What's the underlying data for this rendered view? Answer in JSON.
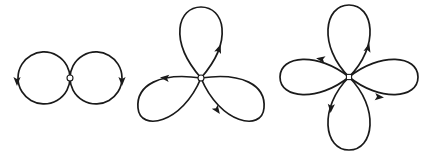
{
  "diagram": {
    "colors": {
      "stroke": "#1a1a1a",
      "background": "#ffffff",
      "node_fill": "#ffffff"
    },
    "figures": [
      {
        "name": "two-loop-figure",
        "petal_count": 2,
        "center": [
          70,
          78
        ],
        "node": "circle",
        "loops": [
          {
            "name": "left-loop",
            "path": "M70,78 A26,26 0 1,1 70,77.9",
            "cx": 44,
            "cy": 78,
            "r": 26
          },
          {
            "name": "right-loop",
            "path": "M70,78 A26,26 0 1,0 70,77.9",
            "cx": 96,
            "cy": 78,
            "r": 26
          }
        ],
        "arrows": [
          {
            "name": "left-loop-arrow",
            "x": 17,
            "y": 81,
            "angle": 90
          },
          {
            "name": "right-loop-arrow",
            "x": 122,
            "y": 81,
            "angle": 90
          }
        ]
      },
      {
        "name": "three-petal-figure",
        "petal_count": 3,
        "center": [
          201,
          78
        ],
        "node": "circle",
        "loops": [
          {
            "name": "top-petal",
            "path": "M201,78 C168,40 178,7 201,7 C224,7 234,40 201,78"
          },
          {
            "name": "lower-left-petal",
            "path": "M201,78 C160,72 136,85 138,108 C140,132 182,124 201,78"
          },
          {
            "name": "lower-right-petal",
            "path": "M201,78 C242,72 266,85 264,108 C262,132 220,124 201,78"
          }
        ],
        "arrows": [
          {
            "name": "top-petal-arrow",
            "x": 219,
            "y": 49,
            "angle": -70
          },
          {
            "name": "lower-left-petal-arrow",
            "x": 165,
            "y": 78,
            "angle": 185
          },
          {
            "name": "lower-right-petal-arrow",
            "x": 217,
            "y": 110,
            "angle": 55
          }
        ]
      },
      {
        "name": "four-petal-figure",
        "petal_count": 4,
        "center": [
          349,
          77
        ],
        "node": "square",
        "loops": [
          {
            "name": "top-petal",
            "path": "M349,77 C318,46 324,5 349,5 C374,5 380,46 349,77"
          },
          {
            "name": "bottom-petal",
            "path": "M349,77 C318,108 324,150 349,150 C374,150 380,108 349,77"
          },
          {
            "name": "left-petal",
            "path": "M349,77 C318,52 280,55 280,77 C280,99 318,102 349,77"
          },
          {
            "name": "right-petal",
            "path": "M349,77 C380,52 418,55 418,77 C418,99 380,102 349,77"
          }
        ],
        "arrows": [
          {
            "name": "top-petal-arrow",
            "x": 368,
            "y": 48,
            "angle": -75
          },
          {
            "name": "left-petal-arrow",
            "x": 321,
            "y": 59,
            "angle": 190
          },
          {
            "name": "right-petal-arrow",
            "x": 379,
            "y": 97,
            "angle": 5
          },
          {
            "name": "bottom-petal-arrow",
            "x": 331,
            "y": 108,
            "angle": 95
          }
        ]
      }
    ]
  }
}
